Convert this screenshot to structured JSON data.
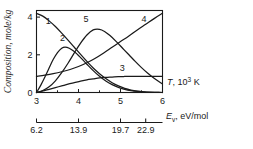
{
  "chart_data": {
    "type": "line",
    "title": "",
    "xlabel": "T, 10^3 K",
    "ylabel": "Composition, mole/kg",
    "xlim": [
      3,
      6
    ],
    "ylim": [
      0,
      4.35
    ],
    "grid": false,
    "legend": "inline-curve-numbers",
    "x_ticks": [
      "3",
      "4",
      "5",
      "6"
    ],
    "x_tick_values": [
      3,
      4,
      5,
      6
    ],
    "y_ticks": [
      "0",
      "2",
      "4"
    ],
    "y_tick_values": [
      0,
      2,
      4
    ],
    "secondary_axis": {
      "label": "E_v, eV/mol",
      "label_symbol": "E",
      "label_subscript": "v",
      "label_units": ", eV/mol",
      "ticks": [
        "6.2",
        "13.9",
        "19.7",
        "22.9"
      ],
      "tick_values": [
        6.2,
        13.9,
        19.7,
        22.9
      ],
      "tick_positions_in_T": [
        3.0,
        4.0,
        5.0,
        5.6
      ]
    },
    "series": [
      {
        "name": "1",
        "label": "1",
        "label_x": 3.28,
        "label_y": 3.62,
        "points": [
          [
            3.0,
            4.2
          ],
          [
            3.15,
            4.05
          ],
          [
            3.3,
            3.8
          ],
          [
            3.45,
            3.5
          ],
          [
            3.6,
            3.15
          ],
          [
            3.75,
            2.78
          ],
          [
            3.9,
            2.4
          ],
          [
            4.05,
            2.02
          ],
          [
            4.2,
            1.65
          ],
          [
            4.35,
            1.3
          ],
          [
            4.5,
            1.0
          ],
          [
            4.65,
            0.74
          ],
          [
            4.8,
            0.52
          ],
          [
            4.95,
            0.35
          ],
          [
            5.1,
            0.22
          ],
          [
            5.25,
            0.13
          ],
          [
            5.4,
            0.07
          ],
          [
            5.55,
            0.035
          ],
          [
            5.7,
            0.015
          ],
          [
            5.85,
            0.006
          ],
          [
            6.0,
            0.0
          ]
        ]
      },
      {
        "name": "2",
        "label": "2",
        "label_x": 3.62,
        "label_y": 2.72,
        "points": [
          [
            3.0,
            0.0
          ],
          [
            3.1,
            0.38
          ],
          [
            3.2,
            0.82
          ],
          [
            3.3,
            1.3
          ],
          [
            3.4,
            1.76
          ],
          [
            3.5,
            2.12
          ],
          [
            3.6,
            2.35
          ],
          [
            3.68,
            2.41
          ],
          [
            3.78,
            2.35
          ],
          [
            3.9,
            2.17
          ],
          [
            4.05,
            1.85
          ],
          [
            4.2,
            1.5
          ],
          [
            4.35,
            1.16
          ],
          [
            4.5,
            0.86
          ],
          [
            4.65,
            0.61
          ],
          [
            4.8,
            0.42
          ],
          [
            4.95,
            0.27
          ],
          [
            5.1,
            0.17
          ],
          [
            5.25,
            0.1
          ],
          [
            5.4,
            0.055
          ],
          [
            5.55,
            0.028
          ],
          [
            5.7,
            0.013
          ],
          [
            5.85,
            0.005
          ],
          [
            6.0,
            0.0
          ]
        ]
      },
      {
        "name": "3",
        "label": "3",
        "label_x": 5.04,
        "label_y": 1.16,
        "points": [
          [
            3.0,
            0.0
          ],
          [
            3.15,
            0.08
          ],
          [
            3.3,
            0.17
          ],
          [
            3.45,
            0.26
          ],
          [
            3.6,
            0.35
          ],
          [
            3.75,
            0.44
          ],
          [
            3.9,
            0.52
          ],
          [
            4.05,
            0.6
          ],
          [
            4.2,
            0.67
          ],
          [
            4.35,
            0.72
          ],
          [
            4.5,
            0.77
          ],
          [
            4.65,
            0.8
          ],
          [
            4.8,
            0.82
          ],
          [
            4.95,
            0.84
          ],
          [
            5.1,
            0.85
          ],
          [
            5.3,
            0.86
          ],
          [
            5.5,
            0.86
          ],
          [
            5.75,
            0.86
          ],
          [
            6.0,
            0.86
          ]
        ]
      },
      {
        "name": "4",
        "label": "4",
        "label_x": 5.56,
        "label_y": 3.72,
        "points": [
          [
            3.0,
            0.85
          ],
          [
            3.2,
            0.92
          ],
          [
            3.4,
            1.0
          ],
          [
            3.6,
            1.1
          ],
          [
            3.8,
            1.22
          ],
          [
            4.0,
            1.38
          ],
          [
            4.2,
            1.58
          ],
          [
            4.4,
            1.82
          ],
          [
            4.6,
            2.1
          ],
          [
            4.8,
            2.4
          ],
          [
            5.0,
            2.7
          ],
          [
            5.2,
            3.0
          ],
          [
            5.4,
            3.32
          ],
          [
            5.6,
            3.62
          ],
          [
            5.8,
            3.92
          ],
          [
            6.0,
            4.2
          ]
        ]
      },
      {
        "name": "5",
        "label": "5",
        "label_x": 4.18,
        "label_y": 3.72,
        "points": [
          [
            3.0,
            0.0
          ],
          [
            3.15,
            0.1
          ],
          [
            3.3,
            0.3
          ],
          [
            3.45,
            0.62
          ],
          [
            3.6,
            1.05
          ],
          [
            3.75,
            1.55
          ],
          [
            3.9,
            2.1
          ],
          [
            4.05,
            2.62
          ],
          [
            4.2,
            3.05
          ],
          [
            4.35,
            3.32
          ],
          [
            4.5,
            3.35
          ],
          [
            4.62,
            3.24
          ],
          [
            4.75,
            3.02
          ],
          [
            4.9,
            2.7
          ],
          [
            5.05,
            2.35
          ],
          [
            5.2,
            2.0
          ],
          [
            5.35,
            1.65
          ],
          [
            5.5,
            1.32
          ],
          [
            5.65,
            1.02
          ],
          [
            5.8,
            0.75
          ],
          [
            6.0,
            0.45
          ]
        ]
      }
    ]
  }
}
